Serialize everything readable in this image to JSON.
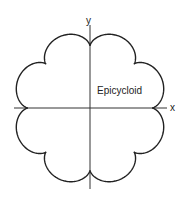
{
  "diagram": {
    "title": "Epicycloid",
    "curve_label": "Epicycloid",
    "axes": {
      "x_label": "x",
      "y_label": "y"
    },
    "geometry": {
      "center": [
        90,
        108
      ],
      "cusps": 8,
      "fixed_radius": 62,
      "rolling_radius": 7.75,
      "x_axis": [
        14,
        167
      ],
      "y_axis": [
        25,
        189
      ]
    },
    "colors": {
      "stroke": "#222222",
      "background": "#ffffff"
    }
  }
}
